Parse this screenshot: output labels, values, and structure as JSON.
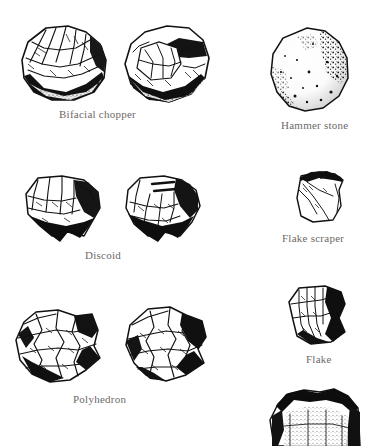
{
  "figure": {
    "kind": "archaeological-tool-plate",
    "background_color": "#ffffff",
    "ink_color": "#111111",
    "caption_color": "#6d6a68",
    "captions": [
      {
        "id": "bifacial-chopper",
        "label": "Bifacial chopper",
        "views": 2
      },
      {
        "id": "hammer-stone",
        "label": "Hammer stone",
        "views": 1
      },
      {
        "id": "discoid",
        "label": "Discoid",
        "views": 2
      },
      {
        "id": "flake-scraper",
        "label": "Flake scraper",
        "views": 1
      },
      {
        "id": "polyhedron",
        "label": "Polyhedron",
        "views": 2
      },
      {
        "id": "flake",
        "label": "Flake",
        "views": 1
      },
      {
        "id": "partial-bottom",
        "label": "",
        "views": 1
      }
    ],
    "items": {
      "bifacial_chopper": "Bifacial chopper",
      "hammer_stone": "Hammer stone",
      "discoid": "Discoid",
      "flake_scraper": "Flake scraper",
      "polyhedron": "Polyhedron",
      "flake": "Flake"
    }
  }
}
